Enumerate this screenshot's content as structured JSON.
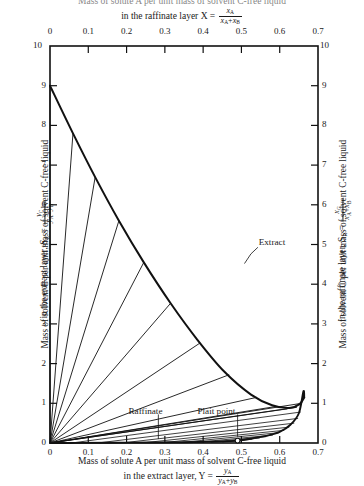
{
  "chart_data": {
    "type": "line",
    "title_top_line1": "Mass of solute A per unit mass of solvent C-free liquid",
    "title_top_line2_pre": "in the raffinate layer X =",
    "title_top_frac_num": "x",
    "title_top_frac_num_sub": "A",
    "title_top_frac_den": "x",
    "title_top_frac_den_sub1": "A",
    "title_top_frac_den_sub2": "B",
    "title_bottom_line1": "Mass of solute A per unit mass of solvent C-free liquid",
    "title_bottom_line2_pre": "in the extract layer, Y =",
    "title_bottom_frac_num": "y",
    "title_bottom_frac_num_sub": "A",
    "title_bottom_frac_den": "y",
    "title_bottom_frac_den_sub1": "A",
    "title_bottom_frac_den_sub2": "B",
    "ylabel_left_line1": "Mass of solvent C per unit mass of solvent C-free liquid",
    "ylabel_left_line2_pre": "in the extract layer, S",
    "ylabel_left_sym_sub": "E",
    "ylabel_left_eq": "=",
    "ylabel_left_frac_num": "y",
    "ylabel_left_frac_num_sub": "C",
    "ylabel_left_frac_den": "y",
    "ylabel_left_frac_den_sub1": "A",
    "ylabel_left_frac_den_sub2": "B",
    "ylabel_right_line1": "Mass of solvent C per unit mass of solvent C-free liquid",
    "ylabel_right_line2_pre": "in the raffinate layer, S",
    "ylabel_right_sym_sub": "R",
    "ylabel_right_eq": "=",
    "ylabel_right_frac_num": "x",
    "ylabel_right_frac_num_sub": "C",
    "ylabel_right_frac_den": "x",
    "ylabel_right_frac_den_sub1": "A",
    "ylabel_right_frac_den_sub2": "B",
    "xlim": [
      0,
      0.7
    ],
    "ylim": [
      0,
      10
    ],
    "xticks": [
      "0",
      "0.1",
      "0.2",
      "0.3",
      "0.4",
      "0.5",
      "0.6",
      "0.7"
    ],
    "xtick_values": [
      0,
      0.1,
      0.2,
      0.3,
      0.4,
      0.5,
      0.6,
      0.7
    ],
    "yticks": [
      "0",
      "1",
      "2",
      "3",
      "4",
      "5",
      "6",
      "7",
      "8",
      "9",
      "10"
    ],
    "ytick_values": [
      0,
      1,
      2,
      3,
      4,
      5,
      6,
      7,
      8,
      9,
      10
    ],
    "grid": false,
    "legend": "none",
    "axis_note_top_left": "10",
    "axis_note_top_right": "10",
    "axis_note_bottom_left": "0",
    "axis_note_bottom_right": "0",
    "annotations": [
      {
        "name": "extract",
        "label": "Extract",
        "x": 0.545,
        "y": 5.05
      },
      {
        "name": "raffinate",
        "label": "Raffinate",
        "x": 0.205,
        "y": 0.78
      },
      {
        "name": "plait-point",
        "label": "Plait point",
        "x": 0.385,
        "y": 0.78
      }
    ],
    "plait_point": {
      "x": 0.49,
      "y": 0.06,
      "marker": "open-circle"
    },
    "binodal_curve_name": "binodal-solubility-curve",
    "binodal_curve": [
      [
        0.0,
        9.0
      ],
      [
        0.03,
        8.4
      ],
      [
        0.06,
        7.8
      ],
      [
        0.09,
        7.22
      ],
      [
        0.12,
        6.66
      ],
      [
        0.15,
        6.12
      ],
      [
        0.18,
        5.6
      ],
      [
        0.21,
        5.1
      ],
      [
        0.245,
        4.55
      ],
      [
        0.28,
        4.02
      ],
      [
        0.315,
        3.52
      ],
      [
        0.35,
        3.05
      ],
      [
        0.385,
        2.6
      ],
      [
        0.42,
        2.18
      ],
      [
        0.455,
        1.8
      ],
      [
        0.49,
        1.48
      ],
      [
        0.525,
        1.22
      ],
      [
        0.56,
        1.02
      ],
      [
        0.59,
        0.9
      ],
      [
        0.615,
        0.84
      ],
      [
        0.638,
        0.84
      ],
      [
        0.655,
        0.92
      ],
      [
        0.664,
        1.06
      ],
      [
        0.663,
        1.18
      ],
      [
        0.655,
        0.72
      ],
      [
        0.66,
        0.88
      ]
    ],
    "binodal_upper_branch": [
      [
        0.0,
        9.0
      ],
      [
        0.06,
        7.8
      ],
      [
        0.12,
        6.66
      ],
      [
        0.18,
        5.6
      ],
      [
        0.245,
        4.55
      ],
      [
        0.315,
        3.52
      ],
      [
        0.385,
        2.6
      ],
      [
        0.455,
        1.8
      ],
      [
        0.525,
        1.22
      ],
      [
        0.58,
        0.95
      ],
      [
        0.625,
        0.88
      ],
      [
        0.652,
        0.98
      ],
      [
        0.664,
        1.15
      ]
    ],
    "binodal_lower_branch": [
      [
        0.664,
        1.15
      ],
      [
        0.662,
        1.3
      ],
      [
        0.65,
        0.75
      ],
      [
        0.628,
        0.46
      ],
      [
        0.6,
        0.28
      ],
      [
        0.565,
        0.18
      ],
      [
        0.53,
        0.12
      ],
      [
        0.49,
        0.06
      ],
      [
        0.43,
        0.035
      ],
      [
        0.35,
        0.02
      ],
      [
        0.26,
        0.012
      ],
      [
        0.16,
        0.006
      ],
      [
        0.07,
        0.002
      ],
      [
        0.0,
        0.0
      ]
    ],
    "tie_lines_name": "tie-lines",
    "tie_lines_origin": [
      0.0,
      0.0
    ],
    "tie_lines": [
      {
        "extract_end": [
          0.0,
          9.0
        ],
        "raffinate_end": [
          0.0,
          0.0
        ]
      },
      {
        "extract_end": [
          0.06,
          7.8
        ],
        "raffinate_end": [
          0.0,
          0.0
        ]
      },
      {
        "extract_end": [
          0.118,
          6.7
        ],
        "raffinate_end": [
          0.0,
          0.0
        ]
      },
      {
        "extract_end": [
          0.18,
          5.6
        ],
        "raffinate_end": [
          0.0,
          0.0
        ]
      },
      {
        "extract_end": [
          0.245,
          4.55
        ],
        "raffinate_end": [
          0.0,
          0.0
        ]
      },
      {
        "extract_end": [
          0.315,
          3.52
        ],
        "raffinate_end": [
          0.0,
          0.0
        ]
      },
      {
        "extract_end": [
          0.392,
          2.52
        ],
        "raffinate_end": [
          0.0,
          0.0
        ]
      },
      {
        "extract_end": [
          0.468,
          1.72
        ],
        "raffinate_end": [
          0.0,
          0.0
        ]
      },
      {
        "extract_end": [
          0.54,
          1.15
        ],
        "raffinate_end": [
          0.0,
          0.0
        ]
      },
      {
        "extract_end": [
          0.59,
          0.92
        ],
        "raffinate_end": [
          0.0,
          0.0
        ]
      },
      {
        "extract_end": [
          0.62,
          0.86
        ],
        "raffinate_end": [
          0.0,
          0.0
        ]
      },
      {
        "extract_end": [
          0.645,
          0.9
        ],
        "raffinate_end": [
          0.0,
          0.0
        ]
      },
      {
        "extract_end": [
          0.657,
          1.0
        ],
        "raffinate_end": [
          0.0,
          0.0
        ]
      }
    ],
    "tie_lines_to_plait": [
      {
        "from": [
          0.655,
          0.78
        ],
        "to": [
          0.06,
          0.004
        ]
      },
      {
        "from": [
          0.648,
          0.62
        ],
        "to": [
          0.13,
          0.006
        ]
      },
      {
        "from": [
          0.638,
          0.5
        ],
        "to": [
          0.195,
          0.009
        ]
      },
      {
        "from": [
          0.625,
          0.4
        ],
        "to": [
          0.25,
          0.011
        ]
      },
      {
        "from": [
          0.612,
          0.32
        ],
        "to": [
          0.3,
          0.013
        ]
      },
      {
        "from": [
          0.598,
          0.26
        ],
        "to": [
          0.345,
          0.016
        ]
      },
      {
        "from": [
          0.582,
          0.2
        ],
        "to": [
          0.385,
          0.019
        ]
      },
      {
        "from": [
          0.565,
          0.16
        ],
        "to": [
          0.42,
          0.022
        ]
      },
      {
        "from": [
          0.548,
          0.125
        ],
        "to": [
          0.45,
          0.028
        ]
      },
      {
        "from": [
          0.528,
          0.095
        ],
        "to": [
          0.47,
          0.035
        ]
      }
    ]
  }
}
